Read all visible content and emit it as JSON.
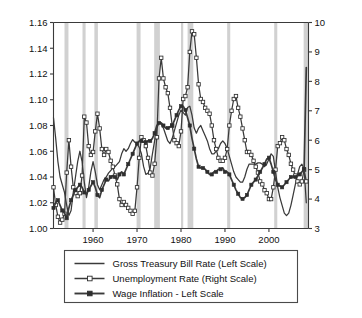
{
  "chart_data": {
    "type": "line",
    "title": "",
    "subtitle": "",
    "xlabel": "",
    "ylabel": "",
    "y2label": "",
    "grid": false,
    "xlim": [
      1951,
      2009
    ],
    "ylim_left": [
      1.0,
      1.16
    ],
    "ylim_right": [
      3,
      10
    ],
    "left_ticks": [
      "1.00",
      "1.02",
      "1.04",
      "1.06",
      "1.08",
      "1.10",
      "1.12",
      "1.14",
      "1.16"
    ],
    "left_tick_values": [
      1.0,
      1.02,
      1.04,
      1.06,
      1.08,
      1.1,
      1.12,
      1.14,
      1.16
    ],
    "right_ticks": [
      "3",
      "4",
      "5",
      "6",
      "7",
      "8",
      "9",
      "10"
    ],
    "right_tick_values": [
      3,
      4,
      5,
      6,
      7,
      8,
      9,
      10
    ],
    "x_ticks": [
      "1960",
      "1970",
      "1980",
      "1990",
      "2000"
    ],
    "x_tick_values": [
      1960,
      1970,
      1980,
      1990,
      2000
    ],
    "legend_position": "below-plot",
    "legend": [
      {
        "label": "Gross Treasury Bill Rate (Left Scale)",
        "marker": "none",
        "color": "#333333"
      },
      {
        "label": "Unemployment Rate (Right Scale)",
        "marker": "open-square",
        "color": "#333333"
      },
      {
        "label": "Wage Inflation - Left Scale",
        "marker": "filled-square",
        "color": "#333333"
      }
    ],
    "recession_bands": [
      {
        "start": 1953.5,
        "end": 1954.4
      },
      {
        "start": 1957.6,
        "end": 1958.3
      },
      {
        "start": 1960.3,
        "end": 1961.1
      },
      {
        "start": 1969.9,
        "end": 1970.8
      },
      {
        "start": 1973.9,
        "end": 1975.2
      },
      {
        "start": 1980.0,
        "end": 1980.5
      },
      {
        "start": 1981.5,
        "end": 1982.8
      },
      {
        "start": 1990.5,
        "end": 1991.2
      },
      {
        "start": 2001.2,
        "end": 2001.9
      },
      {
        "start": 2007.9,
        "end": 2009.0
      }
    ],
    "series": [
      {
        "name": "Gross Treasury Bill Rate (Left Scale)",
        "axis": "left",
        "marker": "none",
        "x": [
          1951,
          1951.5,
          1952,
          1952.5,
          1953,
          1953.5,
          1954,
          1954.5,
          1955,
          1955.5,
          1956,
          1956.5,
          1957,
          1957.5,
          1958,
          1958.5,
          1959,
          1959.5,
          1960,
          1960.5,
          1961,
          1961.5,
          1962,
          1962.5,
          1963,
          1963.5,
          1964,
          1964.5,
          1965,
          1965.5,
          1966,
          1966.5,
          1967,
          1967.5,
          1968,
          1968.5,
          1969,
          1969.5,
          1970,
          1970.5,
          1971,
          1971.5,
          1972,
          1972.5,
          1973,
          1973.5,
          1974,
          1974.5,
          1975,
          1975.5,
          1976,
          1976.5,
          1977,
          1977.5,
          1978,
          1978.5,
          1979,
          1979.5,
          1980,
          1980.5,
          1981,
          1981.5,
          1982,
          1982.5,
          1983,
          1983.5,
          1984,
          1984.5,
          1985,
          1985.5,
          1986,
          1986.5,
          1987,
          1987.5,
          1988,
          1988.5,
          1989,
          1989.5,
          1990,
          1990.5,
          1991,
          1991.5,
          1992,
          1992.5,
          1993,
          1993.5,
          1994,
          1994.5,
          1995,
          1995.5,
          1996,
          1996.5,
          1997,
          1997.5,
          1998,
          1998.5,
          1999,
          1999.5,
          2000,
          2000.5,
          2001,
          2001.5,
          2002,
          2002.5,
          2003,
          2003.5,
          2004,
          2004.5,
          2005,
          2005.5,
          2006,
          2006.5,
          2007,
          2007.5,
          2008,
          2008.5
        ],
        "y": [
          1.086,
          1.07,
          1.052,
          1.04,
          1.034,
          1.028,
          1.018,
          1.01,
          1.014,
          1.028,
          1.04,
          1.052,
          1.06,
          1.052,
          1.036,
          1.024,
          1.032,
          1.044,
          1.052,
          1.044,
          1.034,
          1.03,
          1.034,
          1.038,
          1.04,
          1.043,
          1.045,
          1.047,
          1.048,
          1.05,
          1.052,
          1.058,
          1.062,
          1.06,
          1.062,
          1.066,
          1.069,
          1.067,
          1.066,
          1.063,
          1.058,
          1.048,
          1.042,
          1.043,
          1.047,
          1.058,
          1.068,
          1.078,
          1.082,
          1.081,
          1.078,
          1.073,
          1.068,
          1.066,
          1.07,
          1.076,
          1.082,
          1.088,
          1.092,
          1.09,
          1.088,
          1.094,
          1.095,
          1.088,
          1.078,
          1.074,
          1.078,
          1.08,
          1.076,
          1.072,
          1.068,
          1.062,
          1.058,
          1.058,
          1.06,
          1.062,
          1.066,
          1.068,
          1.066,
          1.062,
          1.056,
          1.05,
          1.044,
          1.04,
          1.038,
          1.036,
          1.036,
          1.04,
          1.046,
          1.05,
          1.05,
          1.05,
          1.05,
          1.051,
          1.051,
          1.05,
          1.048,
          1.05,
          1.054,
          1.058,
          1.056,
          1.044,
          1.032,
          1.024,
          1.018,
          1.012,
          1.01,
          1.012,
          1.018,
          1.026,
          1.034,
          1.042,
          1.048,
          1.05,
          1.046,
          1.02
        ]
      },
      {
        "name": "Unemployment Rate (Right Scale)",
        "axis": "right",
        "marker": "open-square",
        "x": [
          1951,
          1951.5,
          1952,
          1952.5,
          1953,
          1953.5,
          1954,
          1954.5,
          1955,
          1955.5,
          1956,
          1956.5,
          1957,
          1957.5,
          1958,
          1958.5,
          1959,
          1959.5,
          1960,
          1960.5,
          1961,
          1961.5,
          1962,
          1962.5,
          1963,
          1963.5,
          1964,
          1964.5,
          1965,
          1965.5,
          1966,
          1966.5,
          1967,
          1967.5,
          1968,
          1968.5,
          1969,
          1969.5,
          1970,
          1970.5,
          1971,
          1971.5,
          1972,
          1972.5,
          1973,
          1973.5,
          1974,
          1974.5,
          1975,
          1975.5,
          1976,
          1976.5,
          1977,
          1977.5,
          1978,
          1978.5,
          1979,
          1979.5,
          1980,
          1980.5,
          1981,
          1981.5,
          1982,
          1982.5,
          1983,
          1983.5,
          1984,
          1984.5,
          1985,
          1985.5,
          1986,
          1986.5,
          1987,
          1987.5,
          1988,
          1988.5,
          1989,
          1989.5,
          1990,
          1990.5,
          1991,
          1991.5,
          1992,
          1992.5,
          1993,
          1993.5,
          1994,
          1994.5,
          1995,
          1995.5,
          1996,
          1996.5,
          1997,
          1997.5,
          1998,
          1998.5,
          1999,
          1999.5,
          2000,
          2000.5,
          2001,
          2001.5,
          2002,
          2002.5,
          2003,
          2003.5,
          2004,
          2004.5,
          2005,
          2005.5,
          2006,
          2006.5,
          2007,
          2007.5,
          2008,
          2008.5
        ],
        "y": [
          4.4,
          3.8,
          3.4,
          3.2,
          3.3,
          3.5,
          4.9,
          6.0,
          5.1,
          4.4,
          4.2,
          4.1,
          4.2,
          4.8,
          6.8,
          6.6,
          5.8,
          5.5,
          5.6,
          6.3,
          6.9,
          6.4,
          5.7,
          5.5,
          5.7,
          5.6,
          5.3,
          5.1,
          4.8,
          4.5,
          4.0,
          3.8,
          3.9,
          3.8,
          3.7,
          3.6,
          3.5,
          3.6,
          4.4,
          5.4,
          6.1,
          6.0,
          5.8,
          5.4,
          4.9,
          4.8,
          5.2,
          6.1,
          8.1,
          8.8,
          8.1,
          7.8,
          7.6,
          7.1,
          6.5,
          6.0,
          5.9,
          5.8,
          6.3,
          7.4,
          7.5,
          7.8,
          9.0,
          9.7,
          9.6,
          8.8,
          7.9,
          7.4,
          7.3,
          7.1,
          7.0,
          6.9,
          6.5,
          6.0,
          5.7,
          5.4,
          5.3,
          5.3,
          5.4,
          5.7,
          6.5,
          7.0,
          7.4,
          7.5,
          7.1,
          6.8,
          6.4,
          6.0,
          5.6,
          5.6,
          5.5,
          5.3,
          5.1,
          4.9,
          4.6,
          4.5,
          4.3,
          4.2,
          4.0,
          4.0,
          4.4,
          5.0,
          5.8,
          5.9,
          6.1,
          6.0,
          5.7,
          5.5,
          5.2,
          5.0,
          4.8,
          4.6,
          4.5,
          4.6,
          5.0,
          4.6
        ]
      },
      {
        "name": "Wage Inflation - Left Scale",
        "axis": "left",
        "marker": "filled-square",
        "x": [
          1951,
          1951.5,
          1952,
          1952.5,
          1953,
          1953.5,
          1954,
          1954.5,
          1955,
          1955.5,
          1956,
          1956.5,
          1957,
          1957.5,
          1958,
          1958.5,
          1959,
          1959.5,
          1960,
          1960.5,
          1961,
          1961.5,
          1962,
          1962.5,
          1963,
          1963.5,
          1964,
          1964.5,
          1965,
          1965.5,
          1966,
          1966.5,
          1967,
          1967.5,
          1968,
          1968.5,
          1969,
          1969.5,
          1970,
          1970.5,
          1971,
          1971.5,
          1972,
          1972.5,
          1973,
          1973.5,
          1974,
          1974.5,
          1975,
          1975.5,
          1976,
          1976.5,
          1977,
          1977.5,
          1978,
          1978.5,
          1979,
          1979.5,
          1980,
          1980.5,
          1981,
          1981.5,
          1982,
          1982.5,
          1983,
          1983.5,
          1984,
          1984.5,
          1985,
          1985.5,
          1986,
          1986.5,
          1987,
          1987.5,
          1988,
          1988.5,
          1989,
          1989.5,
          1990,
          1990.5,
          1991,
          1991.5,
          1992,
          1992.5,
          1993,
          1993.5,
          1994,
          1994.5,
          1995,
          1995.5,
          1996,
          1996.5,
          1997,
          1997.5,
          1998,
          1998.5,
          1999,
          1999.5,
          2000,
          2000.5,
          2001,
          2001.5,
          2002,
          2002.5,
          2003,
          2003.5,
          2004,
          2004.5,
          2005,
          2005.5,
          2006,
          2006.5,
          2007,
          2007.5,
          2008,
          2008.5
        ],
        "y": [
          1.016,
          1.02,
          1.022,
          1.018,
          1.014,
          1.012,
          1.008,
          1.016,
          1.022,
          1.026,
          1.03,
          1.032,
          1.034,
          1.032,
          1.028,
          1.027,
          1.03,
          1.033,
          1.036,
          1.032,
          1.026,
          1.024,
          1.03,
          1.034,
          1.038,
          1.037,
          1.04,
          1.041,
          1.04,
          1.038,
          1.042,
          1.044,
          1.042,
          1.046,
          1.05,
          1.054,
          1.058,
          1.062,
          1.066,
          1.068,
          1.068,
          1.067,
          1.067,
          1.068,
          1.068,
          1.07,
          1.074,
          1.08,
          1.082,
          1.082,
          1.08,
          1.078,
          1.078,
          1.079,
          1.08,
          1.084,
          1.088,
          1.092,
          1.095,
          1.095,
          1.092,
          1.086,
          1.08,
          1.07,
          1.062,
          1.054,
          1.048,
          1.047,
          1.047,
          1.046,
          1.044,
          1.042,
          1.042,
          1.044,
          1.044,
          1.046,
          1.046,
          1.047,
          1.044,
          1.044,
          1.042,
          1.038,
          1.034,
          1.03,
          1.027,
          1.024,
          1.023,
          1.024,
          1.026,
          1.03,
          1.034,
          1.036,
          1.038,
          1.041,
          1.044,
          1.047,
          1.05,
          1.054,
          1.055,
          1.05,
          1.044,
          1.038,
          1.034,
          1.033,
          1.032,
          1.034,
          1.036,
          1.038,
          1.04,
          1.04,
          1.04,
          1.041,
          1.042,
          1.044,
          1.046,
          1.125
        ]
      }
    ]
  }
}
